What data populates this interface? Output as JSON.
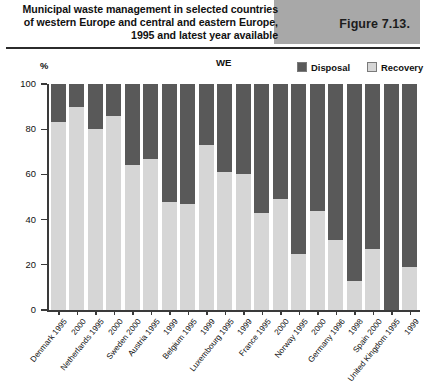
{
  "header": {
    "title": "Municipal waste management in selected countries of western Europe and central and eastern Europe, 1995 and latest year available",
    "figure_label": "Figure 7.13.",
    "figure_box_color": "#a8a8a8"
  },
  "legend": {
    "region_label": "WE",
    "entries": [
      {
        "label": "Disposal",
        "color": "#595959"
      },
      {
        "label": "Recovery",
        "color": "#d6d6d6"
      }
    ]
  },
  "chart_data": {
    "type": "bar",
    "stacked": true,
    "title": "Municipal waste management in selected countries of western Europe and central and eastern Europe, 1995 and latest year available",
    "xlabel": "",
    "ylabel": "%",
    "ylim": [
      0,
      100
    ],
    "yticks": [
      0,
      20,
      40,
      60,
      80,
      100
    ],
    "grid": false,
    "legend_position": "top-right",
    "categories": [
      "Denmark 1995",
      "2000",
      "Netherlands 1995",
      "2000",
      "Sweden 2000",
      "Austria 1995",
      "1999",
      "Belgium 1995",
      "1999",
      "Luxembourg 1995",
      "1999",
      "France 1995",
      "2000",
      "Norway 1995",
      "2000",
      "Germany 1996",
      "1998",
      "Spain 2000",
      "United Kingdom 1995",
      "1999"
    ],
    "country_groups": [
      {
        "country": "Denmark",
        "years": [
          "1995",
          "2000"
        ]
      },
      {
        "country": "Netherlands",
        "years": [
          "1995",
          "2000"
        ]
      },
      {
        "country": "Sweden",
        "years": [
          "2000"
        ]
      },
      {
        "country": "Austria",
        "years": [
          "1995",
          "1999"
        ]
      },
      {
        "country": "Belgium",
        "years": [
          "1995",
          "1999"
        ]
      },
      {
        "country": "Luxembourg",
        "years": [
          "1995",
          "1999"
        ]
      },
      {
        "country": "France",
        "years": [
          "1995",
          "2000"
        ]
      },
      {
        "country": "Norway",
        "years": [
          "1995",
          "2000"
        ]
      },
      {
        "country": "Germany",
        "years": [
          "1996",
          "1998"
        ]
      },
      {
        "country": "Spain",
        "years": [
          "2000"
        ]
      },
      {
        "country": "United Kingdom",
        "years": [
          "1995",
          "1999"
        ]
      }
    ],
    "tick_labels": [
      "Denmark 1995",
      "2000",
      "Netherlands 1995",
      "2000",
      "Sweden 2000",
      "Austria 1995",
      "1999",
      "Belgium 1995",
      "1999",
      "Luxembourg 1995",
      "1999",
      "France 1995",
      "2000",
      "Norway 1995",
      "2000",
      "Germany 1996",
      "1998",
      "Spain 2000",
      "United Kingdom 1995",
      "1999"
    ],
    "bars": [
      {
        "label": "Denmark 1995",
        "recovery": 83,
        "disposal": 17
      },
      {
        "label": "2000",
        "recovery": 90,
        "disposal": 10
      },
      {
        "label": "Netherlands 1995",
        "recovery": 80,
        "disposal": 20
      },
      {
        "label": "2000",
        "recovery": 86,
        "disposal": 14
      },
      {
        "label": "Sweden 2000",
        "recovery": 64,
        "disposal": 36
      },
      {
        "label": "Austria 1995",
        "recovery": 67,
        "disposal": 33
      },
      {
        "label": "1999",
        "recovery": 48,
        "disposal": 52
      },
      {
        "label": "Belgium 1995",
        "recovery": 47,
        "disposal": 53
      },
      {
        "label": "1999",
        "recovery": 73,
        "disposal": 27
      },
      {
        "label": "Luxembourg 1995",
        "recovery": 61,
        "disposal": 39
      },
      {
        "label": "1999",
        "recovery": 60,
        "disposal": 40
      },
      {
        "label": "France 1995",
        "recovery": 43,
        "disposal": 57
      },
      {
        "label": "2000",
        "recovery": 49,
        "disposal": 51
      },
      {
        "label": "Norway 1995",
        "recovery": 25,
        "disposal": 75
      },
      {
        "label": "2000",
        "recovery": 44,
        "disposal": 56
      },
      {
        "label": "Germany 1996",
        "recovery": 31,
        "disposal": 69
      },
      {
        "label": "1998",
        "recovery": 13,
        "disposal": 87
      },
      {
        "label": "Spain 2000",
        "recovery": 27,
        "disposal": 73
      },
      {
        "label": "United Kingdom 1995",
        "recovery": 0,
        "disposal": 100
      },
      {
        "label": "1999",
        "recovery": 19,
        "disposal": 81
      }
    ],
    "series": [
      {
        "name": "Recovery",
        "color": "#d6d6d6",
        "values": [
          83,
          90,
          80,
          86,
          64,
          67,
          48,
          47,
          73,
          61,
          60,
          43,
          49,
          25,
          44,
          31,
          13,
          27,
          0,
          19
        ]
      },
      {
        "name": "Disposal",
        "color": "#595959",
        "values": [
          17,
          10,
          20,
          14,
          36,
          33,
          52,
          53,
          27,
          39,
          40,
          57,
          51,
          75,
          56,
          69,
          87,
          73,
          100,
          81
        ]
      }
    ]
  }
}
